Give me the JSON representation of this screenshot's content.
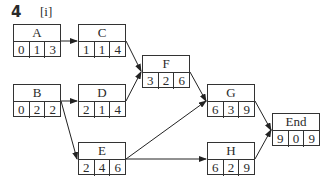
{
  "question": {
    "number": "4",
    "part": "[i]"
  },
  "diagram": {
    "type": "activity-on-node network",
    "nodes": [
      {
        "id": "A",
        "label": "A",
        "values": [
          "0",
          "1",
          "3"
        ],
        "x": 13,
        "y": 24
      },
      {
        "id": "C",
        "label": "C",
        "values": [
          "1",
          "1",
          "4"
        ],
        "x": 78,
        "y": 24
      },
      {
        "id": "F",
        "label": "F",
        "values": [
          "3",
          "2",
          "6"
        ],
        "x": 142,
        "y": 55
      },
      {
        "id": "B",
        "label": "B",
        "values": [
          "0",
          "2",
          "2"
        ],
        "x": 13,
        "y": 84
      },
      {
        "id": "D",
        "label": "D",
        "values": [
          "2",
          "1",
          "4"
        ],
        "x": 78,
        "y": 84
      },
      {
        "id": "G",
        "label": "G",
        "values": [
          "6",
          "3",
          "9"
        ],
        "x": 207,
        "y": 84
      },
      {
        "id": "End",
        "label": "End",
        "values": [
          "9",
          "0",
          "9"
        ],
        "x": 272,
        "y": 113
      },
      {
        "id": "E",
        "label": "E",
        "values": [
          "2",
          "4",
          "6"
        ],
        "x": 78,
        "y": 142
      },
      {
        "id": "H",
        "label": "H",
        "values": [
          "6",
          "2",
          "9"
        ],
        "x": 207,
        "y": 142
      }
    ],
    "edges": [
      [
        "A",
        "C"
      ],
      [
        "C",
        "F"
      ],
      [
        "D",
        "F"
      ],
      [
        "B",
        "D"
      ],
      [
        "B",
        "E"
      ],
      [
        "F",
        "G"
      ],
      [
        "E",
        "G"
      ],
      [
        "E",
        "H"
      ],
      [
        "G",
        "End"
      ],
      [
        "H",
        "End"
      ]
    ]
  }
}
